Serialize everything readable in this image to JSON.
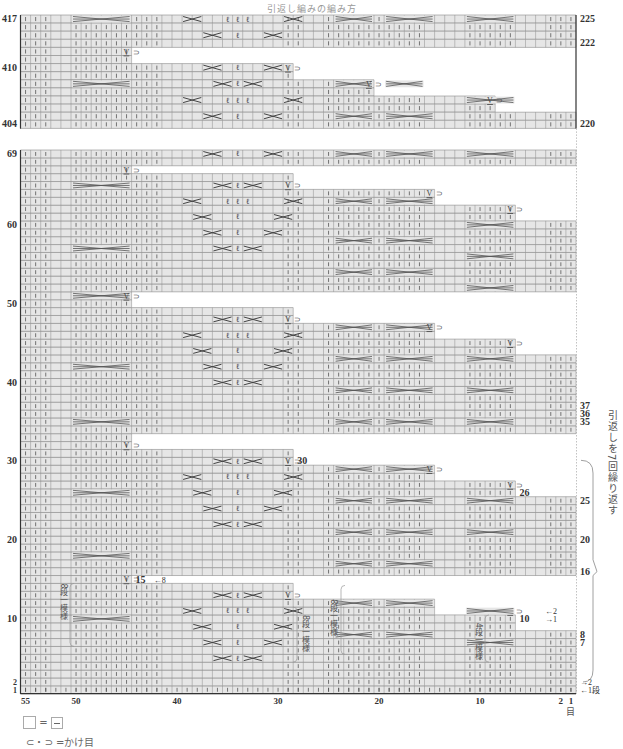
{
  "title": "引返し編みの編み方",
  "chart_data": {
    "type": "table",
    "grid": {
      "columns": 55,
      "x_axis_ticks": [
        55,
        50,
        40,
        30,
        20,
        10,
        2,
        1
      ],
      "x_axis_suffix": "目",
      "row_suffix": "段"
    },
    "left_row_labels_top_block": [
      417,
      410,
      404
    ],
    "right_row_labels_top_block": [
      225,
      222,
      220
    ],
    "left_row_labels_main_block": [
      69,
      60,
      50,
      40,
      30,
      20,
      10,
      2,
      1
    ],
    "right_row_labels_main_block": [
      37,
      36,
      35,
      30,
      26,
      25,
      20,
      16,
      15,
      10,
      8,
      7,
      2,
      1
    ],
    "symbols": {
      "purl_bar": "|",
      "cable_cross_wide": ">=<",
      "cross_2": "X",
      "twisted_knit": "Q",
      "slip_yo": "V⊃"
    },
    "annotations": {
      "repeat_bracket": "引返しを7回繰り返す",
      "pattern_8rows_left": "8段一模様",
      "pattern_8rows_mid": "8段一模様",
      "pattern_8rows_center": "8段一模様",
      "pattern_4rows": "4段一模様",
      "row_arrow_8": "←8",
      "row_arrow_2a": "←2",
      "row_arrow_1a": "→1",
      "row_arrow_2b": "→2",
      "row_arrow_1b": "←1段"
    }
  },
  "legend": {
    "empty_equals": "=",
    "yarn_over_label": "⊂・⊃ =かけ目"
  },
  "axis": {
    "tick_55": "55",
    "tick_50": "50",
    "tick_40": "40",
    "tick_30": "30",
    "tick_20": "20",
    "tick_10": "10",
    "tick_2": "2",
    "tick_1": "1",
    "unit": "目"
  },
  "labels": {
    "l417": "417",
    "l410": "410",
    "l404": "404",
    "r225": "225",
    "r222": "222",
    "r220": "220",
    "l69": "69",
    "l60": "60",
    "l50": "50",
    "l40": "40",
    "l30": "30",
    "l20": "20",
    "l10": "10",
    "l2": "2",
    "l1": "1",
    "r37": "37",
    "r36": "36",
    "r35": "35",
    "r30": "30",
    "r26": "26",
    "r25": "25",
    "r20": "20",
    "r16": "16",
    "r15": "15",
    "r10": "10",
    "r8": "8",
    "r7": "7"
  },
  "annotations": {
    "repeat": "引返しを7回繰り返す",
    "p8a": "8段一模様",
    "p8b": "8段一模様",
    "p8c": "8段一模様",
    "p4": "4段一模様",
    "arrow8": "←8",
    "arrow2a": "←2",
    "arrow1a": "→1",
    "arrow2b": "→2",
    "arrow1b": "←1段"
  }
}
